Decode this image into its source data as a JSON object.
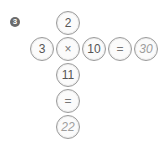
{
  "problem": {
    "number": "3",
    "horizontal": [
      {
        "id": "h0",
        "value": "3",
        "kind": "number",
        "cx": 43,
        "cy": 50
      },
      {
        "id": "h1",
        "value": "×",
        "kind": "operator",
        "cx": 69,
        "cy": 50
      },
      {
        "id": "h2",
        "value": "10",
        "kind": "number",
        "cx": 95,
        "cy": 50
      },
      {
        "id": "h3",
        "value": "=",
        "kind": "operator",
        "cx": 121,
        "cy": 50
      },
      {
        "id": "h4",
        "value": "30",
        "kind": "answer",
        "cx": 147,
        "cy": 50
      }
    ],
    "vertical": [
      {
        "id": "v0",
        "value": "2",
        "kind": "number",
        "cx": 69,
        "cy": 24
      },
      {
        "id": "v2",
        "value": "11",
        "kind": "number",
        "cx": 69,
        "cy": 76
      },
      {
        "id": "v3",
        "value": "=",
        "kind": "operator",
        "cx": 69,
        "cy": 102
      },
      {
        "id": "v4",
        "value": "22",
        "kind": "answer",
        "cx": 69,
        "cy": 128
      }
    ]
  },
  "colors": {
    "badge_bg": "#6b6b6b",
    "circle_border": "#9a9a9a",
    "text": "#555555",
    "answer_text": "#9d9d9d"
  }
}
